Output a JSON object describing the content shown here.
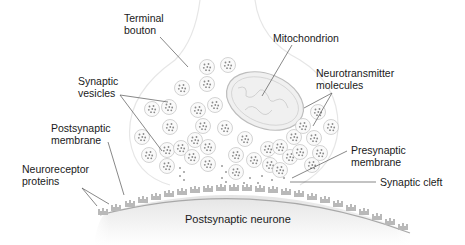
{
  "colors": {
    "background": "#ffffff",
    "text": "#1a1a1a",
    "leader_line": "#555555",
    "bouton_outline": "#e6e6e6",
    "vesicle_fill": "#fafafa",
    "vesicle_stroke": "#c8c8c8",
    "molecule_dot": "#8a8a8a",
    "mitochondrion_fill": "#f0f0f0",
    "mitochondrion_stroke": "#bdbdbd",
    "receptor": "#b9b9b9",
    "postsynaptic_fill": "#ececec"
  },
  "labels": {
    "terminal_bouton": "Terminal\nbouton",
    "mitochondrion": "Mitochondrion",
    "synaptic_vesicles": "Synaptic\nvesicles",
    "neurotransmitter_molecules": "Neurotransmitter\nmolecules",
    "postsynaptic_membrane": "Postsynaptic\nmembrane",
    "neuroreceptor_proteins": "Neuroreceptor\nproteins",
    "presynaptic_membrane": "Presynaptic\nmembrane",
    "synaptic_cleft": "Synaptic cleft",
    "postsynaptic_neurone": "Postsynaptic neurone"
  }
}
